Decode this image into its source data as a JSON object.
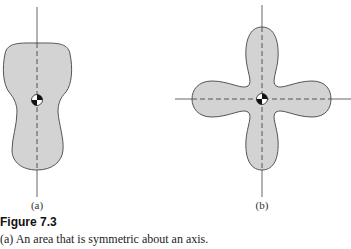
{
  "figure": {
    "number_label": "Figure 7.3",
    "caption": "(a) An area that is symmetric about an axis.",
    "panels": [
      {
        "id": "a",
        "label": "(a)",
        "description": "Area symmetric about a single vertical axis, centroid on the axis"
      },
      {
        "id": "b",
        "label": "(b)",
        "description": "Four-lobed area symmetric about two perpendicular axes, centroid at intersection"
      }
    ],
    "colors": {
      "fill": "#d3d3d3",
      "outline": "#555555",
      "axis": "#666666",
      "symmetry_dash": "#555555"
    }
  }
}
